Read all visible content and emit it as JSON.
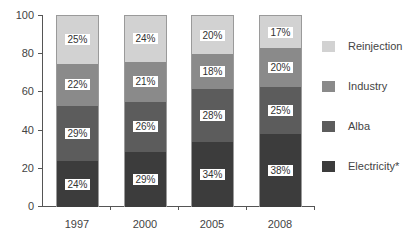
{
  "chart_data": {
    "type": "bar",
    "stacked": true,
    "title": "",
    "xlabel": "",
    "ylabel": "",
    "ylim": [
      0,
      100
    ],
    "yticks": [
      0,
      20,
      40,
      60,
      80,
      100
    ],
    "categories": [
      "1997",
      "2000",
      "2005",
      "2008"
    ],
    "series": [
      {
        "name": "Electricity*",
        "values": [
          24,
          29,
          34,
          38
        ],
        "labels": [
          "24%",
          "29%",
          "34%",
          "38%"
        ],
        "color": "#3c3c3c"
      },
      {
        "name": "Alba",
        "values": [
          29,
          26,
          28,
          25
        ],
        "labels": [
          "29%",
          "26%",
          "28%",
          "25%"
        ],
        "color": "#5c5c5c"
      },
      {
        "name": "Industry",
        "values": [
          22,
          21,
          18,
          20
        ],
        "labels": [
          "22%",
          "21%",
          "18%",
          "20%"
        ],
        "color": "#8a8a8a"
      },
      {
        "name": "Reinjection",
        "values": [
          25,
          24,
          20,
          17
        ],
        "labels": [
          "25%",
          "24%",
          "20%",
          "17%"
        ],
        "color": "#d2d2d2"
      }
    ],
    "legend_position": "right",
    "legend_order": [
      "Reinjection",
      "Industry",
      "Alba",
      "Electricity*"
    ],
    "grid": false
  },
  "axis": {
    "y_tick_labels": [
      "0",
      "20",
      "40",
      "60",
      "80",
      "100"
    ],
    "x_tick_labels": [
      "1997",
      "2000",
      "2005",
      "2008"
    ]
  },
  "legend": [
    {
      "label": "Reinjection",
      "color": "#d2d2d2"
    },
    {
      "label": "Industry",
      "color": "#8a8a8a"
    },
    {
      "label": "Alba",
      "color": "#5c5c5c"
    },
    {
      "label": "Electricity*",
      "color": "#3c3c3c"
    }
  ]
}
